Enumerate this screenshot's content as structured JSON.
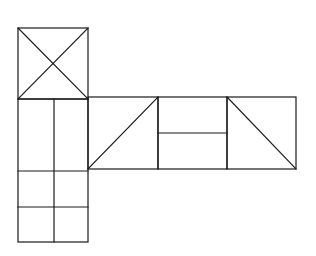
{
  "diagram": {
    "type": "box-net",
    "stroke_color": "#1a1a1a",
    "background": "#ffffff",
    "faces": [
      {
        "id": "top-square",
        "x": 18,
        "y": 28,
        "w": 70,
        "h": 71,
        "marks": [
          "diagonal-both"
        ]
      },
      {
        "id": "left-column",
        "x": 18,
        "y": 99,
        "w": 70,
        "h": 143,
        "marks": [
          "vertical-split-54",
          "horizontal-171",
          "horizontal-207"
        ]
      },
      {
        "id": "face-2",
        "x": 88,
        "y": 97,
        "w": 70,
        "h": 72,
        "marks": [
          "diagonal-bottomleft-to-topright"
        ]
      },
      {
        "id": "face-3",
        "x": 158,
        "y": 97,
        "w": 69,
        "h": 72,
        "marks": [
          "horizontal-133"
        ]
      },
      {
        "id": "face-4",
        "x": 227,
        "y": 97,
        "w": 69,
        "h": 72,
        "marks": [
          "diagonal-topleft-to-bottomright"
        ]
      }
    ]
  }
}
